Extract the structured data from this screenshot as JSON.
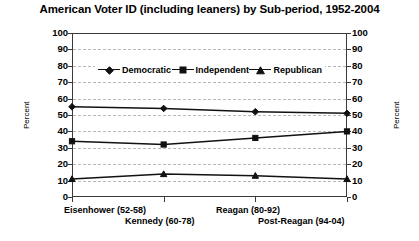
{
  "chart_data": {
    "type": "line",
    "title": "American Voter ID (including leaners) by Sub-period, 1952-2004",
    "xlabel": "",
    "ylabel": "Percent",
    "ylabel_right": "Percent",
    "ylim": [
      0,
      100
    ],
    "ytick_step": 10,
    "yticks": [
      "100",
      "90",
      "80",
      "70",
      "60",
      "50",
      "40",
      "30",
      "20",
      "10",
      "0"
    ],
    "ytick_values": [
      100,
      90,
      80,
      70,
      60,
      50,
      40,
      30,
      20,
      10,
      0
    ],
    "grid": true,
    "legend_position": "top-inside",
    "categories": [
      "Eisenhower (52-58)",
      "Kennedy (60-78)",
      "Reagan (80-92)",
      "Post-Reagan (94-04)"
    ],
    "series": [
      {
        "name": "Democratic",
        "marker": "diamond",
        "values": [
          55,
          54,
          52,
          51
        ]
      },
      {
        "name": "Independent",
        "marker": "square",
        "values": [
          34,
          32,
          36,
          40
        ]
      },
      {
        "name": "Republican",
        "marker": "triangle",
        "values": [
          11,
          14,
          13,
          11
        ]
      }
    ]
  },
  "legend": {
    "items": [
      {
        "label": "Democratic"
      },
      {
        "label": "Independent"
      },
      {
        "label": "Republican"
      }
    ]
  },
  "colors": {
    "line": "#111111",
    "grid": "#b9b9b9",
    "axis": "#3a3a3a",
    "background": "#ffffff"
  }
}
